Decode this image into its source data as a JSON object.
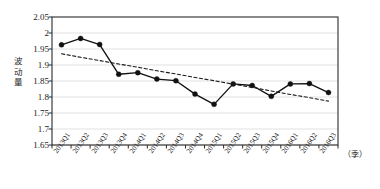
{
  "chart_data": {
    "type": "line",
    "title": "",
    "subtitle": "",
    "xlabel": "（季）",
    "ylabel": "波动量",
    "ylabel_chars": [
      "波",
      "动",
      "量"
    ],
    "categories": [
      "2013Q1",
      "2013Q2",
      "2013Q3",
      "2013Q4",
      "2014Q1",
      "2014Q2",
      "2014Q3",
      "2014Q4",
      "2015Q1",
      "2015Q2",
      "2015Q3",
      "2015Q4",
      "2016Q1",
      "2016Q2",
      "2016Q3"
    ],
    "ylim": [
      1.65,
      2.05
    ],
    "ytick_labels": [
      "2.05",
      "2",
      "1.95",
      "1.9",
      "1.85",
      "1.8",
      "1.75",
      "1.7",
      "1.65"
    ],
    "ytick_values": [
      2.05,
      2.0,
      1.95,
      1.9,
      1.85,
      1.8,
      1.75,
      1.7,
      1.65
    ],
    "grid": true,
    "grid_axis": "y",
    "legend": false,
    "legend_position": "none",
    "series": [
      {
        "name": "波动量",
        "style": "solid-line-with-markers",
        "marker": "filled-circle",
        "color": "#111111",
        "values": [
          1.963,
          1.983,
          1.964,
          1.871,
          1.876,
          1.856,
          1.851,
          1.809,
          1.777,
          1.841,
          1.836,
          1.802,
          1.841,
          1.842,
          1.814
        ]
      },
      {
        "name": "趋势线",
        "style": "dashed-trendline",
        "marker": "none",
        "color": "#1a1a1a",
        "values": [
          1.935,
          1.924,
          1.914,
          1.903,
          1.893,
          1.882,
          1.872,
          1.861,
          1.851,
          1.84,
          1.83,
          1.819,
          1.808,
          1.798,
          1.787
        ]
      }
    ],
    "colors": {
      "line": "#111111",
      "marker": "#111111",
      "trendline": "#1a1a1a",
      "gridline": "#d9d9d9",
      "axis": "#2b2b2b",
      "background": "#ffffff"
    }
  }
}
